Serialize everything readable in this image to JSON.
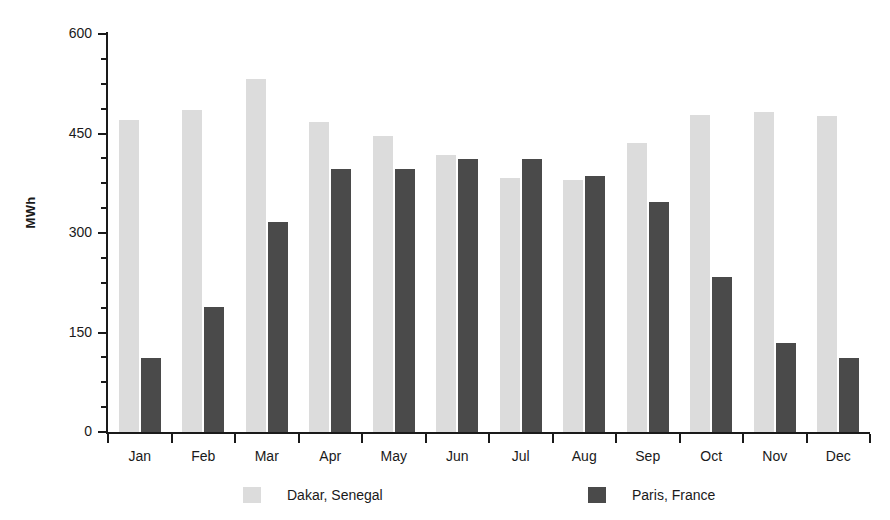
{
  "chart_data": {
    "type": "bar",
    "title": "",
    "xlabel": "",
    "ylabel": "MWh",
    "ylim": [
      0,
      600
    ],
    "ytick_labels": [
      "0",
      "150",
      "300",
      "450",
      "600"
    ],
    "ytick_values": [
      0,
      150,
      300,
      450,
      600
    ],
    "yminor_step": 37.5,
    "grid": false,
    "legend_position": "bottom",
    "categories": [
      "Jan",
      "Feb",
      "Mar",
      "Apr",
      "May",
      "Jun",
      "Jul",
      "Aug",
      "Sep",
      "Oct",
      "Nov",
      "Dec"
    ],
    "series": [
      {
        "name": "Dakar, Senegal",
        "color": "#dcdcdc",
        "values": [
          470,
          485,
          532,
          468,
          447,
          418,
          383,
          380,
          435,
          478,
          482,
          477
        ]
      },
      {
        "name": "Paris, France",
        "color": "#4a4a4a",
        "values": [
          112,
          188,
          317,
          397,
          397,
          411,
          411,
          386,
          347,
          233,
          134,
          112
        ]
      }
    ]
  },
  "axis": {
    "y_label": "MWh"
  },
  "legend": {
    "items": [
      {
        "label": "Dakar, Senegal",
        "color": "#dcdcdc"
      },
      {
        "label": "Paris, France",
        "color": "#4a4a4a"
      }
    ]
  },
  "colors": {
    "dakar": "#dcdcdc",
    "paris": "#4a4a4a",
    "axis": "#1a1a1a",
    "background": "#ffffff"
  }
}
